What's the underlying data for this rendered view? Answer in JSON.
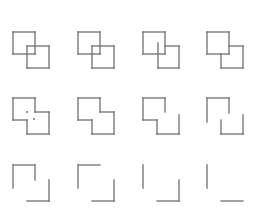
{
  "figure": {
    "stroke_color": "#707070",
    "stroke_width": 1.3,
    "dot_color": "#606060",
    "grid": {
      "columns": 4,
      "rows": 3
    },
    "panels": [
      {
        "id": 1,
        "origin": [
          13,
          32
        ],
        "segments": [
          [
            0,
            0,
            22,
            0
          ],
          [
            22,
            0,
            22,
            22
          ],
          [
            22,
            22,
            0,
            22
          ],
          [
            0,
            22,
            0,
            0
          ],
          [
            14,
            14,
            36,
            14
          ],
          [
            36,
            14,
            36,
            36
          ],
          [
            36,
            36,
            14,
            36
          ],
          [
            14,
            36,
            14,
            14
          ]
        ],
        "dots": []
      },
      {
        "id": 2,
        "origin": [
          78,
          32
        ],
        "segments": [
          [
            0,
            0,
            22,
            0
          ],
          [
            22,
            0,
            22,
            22
          ],
          [
            22,
            22,
            0,
            22
          ],
          [
            0,
            22,
            0,
            0
          ],
          [
            14,
            14,
            36,
            14
          ],
          [
            36,
            14,
            36,
            36
          ],
          [
            36,
            36,
            14,
            36
          ],
          [
            14,
            36,
            14,
            14
          ]
        ],
        "dots": []
      },
      {
        "id": 3,
        "origin": [
          143,
          32
        ],
        "segments": [
          [
            0,
            0,
            22,
            0
          ],
          [
            22,
            0,
            22,
            22
          ],
          [
            22,
            22,
            0,
            22
          ],
          [
            0,
            22,
            0,
            0
          ],
          [
            22,
            14,
            36,
            14
          ],
          [
            36,
            14,
            36,
            36
          ],
          [
            36,
            36,
            15,
            36
          ],
          [
            15,
            36,
            15,
            11
          ]
        ],
        "dots": []
      },
      {
        "id": 4,
        "origin": [
          207,
          32
        ],
        "segments": [
          [
            0,
            0,
            22,
            0
          ],
          [
            22,
            0,
            22,
            22
          ],
          [
            22,
            22,
            14,
            22
          ],
          [
            0,
            22,
            0,
            0
          ],
          [
            0,
            22,
            14,
            22
          ],
          [
            22,
            14,
            36,
            14
          ],
          [
            36,
            14,
            36,
            36
          ],
          [
            36,
            36,
            14,
            36
          ],
          [
            14,
            36,
            14,
            22
          ]
        ],
        "dots": []
      },
      {
        "id": 5,
        "origin": [
          13,
          98
        ],
        "segments": [
          [
            0,
            0,
            22,
            0
          ],
          [
            22,
            0,
            22,
            14
          ],
          [
            22,
            14,
            36,
            14
          ],
          [
            36,
            14,
            36,
            36
          ],
          [
            36,
            36,
            14,
            36
          ],
          [
            14,
            36,
            14,
            22
          ],
          [
            14,
            22,
            0,
            22
          ],
          [
            0,
            22,
            0,
            0
          ]
        ],
        "dots": [
          [
            14,
            14
          ],
          [
            21,
            21
          ]
        ]
      },
      {
        "id": 6,
        "origin": [
          78,
          98
        ],
        "segments": [
          [
            0,
            0,
            22,
            0
          ],
          [
            22,
            0,
            22,
            14
          ],
          [
            22,
            14,
            36,
            14
          ],
          [
            36,
            14,
            36,
            36
          ],
          [
            36,
            36,
            14,
            36
          ],
          [
            14,
            36,
            14,
            22
          ],
          [
            14,
            22,
            0,
            22
          ],
          [
            0,
            22,
            0,
            0
          ]
        ],
        "dots": []
      },
      {
        "id": 7,
        "origin": [
          143,
          98
        ],
        "segments": [
          [
            0,
            0,
            22,
            0
          ],
          [
            22,
            0,
            22,
            14
          ],
          [
            36,
            17,
            36,
            36
          ],
          [
            36,
            36,
            14,
            36
          ],
          [
            14,
            36,
            14,
            22
          ],
          [
            14,
            22,
            0,
            22
          ],
          [
            0,
            22,
            0,
            0
          ]
        ],
        "dots": []
      },
      {
        "id": 8,
        "origin": [
          207,
          98
        ],
        "segments": [
          [
            0,
            0,
            22,
            0
          ],
          [
            22,
            0,
            22,
            15
          ],
          [
            36,
            17,
            36,
            36
          ],
          [
            36,
            36,
            14,
            36
          ],
          [
            14,
            36,
            14,
            22
          ],
          [
            0,
            24,
            0,
            0
          ]
        ],
        "dots": []
      },
      {
        "id": 9,
        "origin": [
          13,
          165
        ],
        "segments": [
          [
            0,
            0,
            22,
            0
          ],
          [
            22,
            0,
            22,
            15
          ],
          [
            36,
            15,
            36,
            36
          ],
          [
            36,
            36,
            14,
            36
          ],
          [
            0,
            23,
            0,
            0
          ]
        ],
        "dots": []
      },
      {
        "id": 10,
        "origin": [
          78,
          165
        ],
        "segments": [
          [
            0,
            0,
            22,
            0
          ],
          [
            36,
            15,
            36,
            36
          ],
          [
            36,
            36,
            14,
            36
          ],
          [
            0,
            23,
            0,
            0
          ]
        ],
        "dots": []
      },
      {
        "id": 11,
        "origin": [
          143,
          165
        ],
        "segments": [
          [
            36,
            15,
            36,
            36
          ],
          [
            36,
            36,
            14,
            36
          ],
          [
            0,
            23,
            0,
            0
          ]
        ],
        "dots": []
      },
      {
        "id": 12,
        "origin": [
          207,
          165
        ],
        "segments": [
          [
            36,
            36,
            14,
            36
          ],
          [
            0,
            23,
            0,
            0
          ]
        ],
        "dots": []
      }
    ]
  }
}
